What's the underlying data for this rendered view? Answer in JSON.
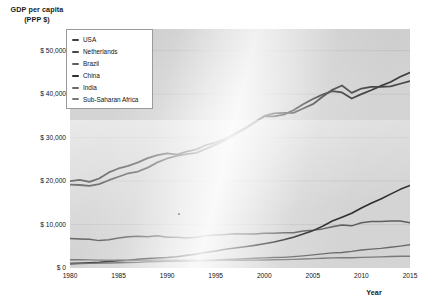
{
  "chart_data": {
    "type": "line",
    "title": "",
    "ylabel": "GDP per capita\n(PPP $)",
    "ylabel_line1": "GDP per capita",
    "ylabel_line2": "(PPP $)",
    "xlabel": "Year",
    "xlim": [
      1980,
      2015
    ],
    "ylim": [
      0,
      55000
    ],
    "grid": true,
    "legend_position": "top-left",
    "yticks": [
      {
        "value": 50000,
        "label": "$ 50,000"
      },
      {
        "value": 40000,
        "label": "$ 40,000"
      },
      {
        "value": 30000,
        "label": "$ 30,000"
      },
      {
        "value": 20000,
        "label": "$ 20,000"
      },
      {
        "value": 10000,
        "label": "$ 10,000"
      },
      {
        "value": 0,
        "label": "$ 0"
      }
    ],
    "xticks": [
      {
        "value": 1980,
        "label": "1980"
      },
      {
        "value": 1985,
        "label": "1985"
      },
      {
        "value": 1990,
        "label": "1990"
      },
      {
        "value": 1995,
        "label": "1995"
      },
      {
        "value": 2000,
        "label": "2000"
      },
      {
        "value": 2005,
        "label": "2005"
      },
      {
        "value": 2010,
        "label": "2010"
      },
      {
        "value": 2015,
        "label": "2015"
      }
    ],
    "x": [
      1980,
      1981,
      1982,
      1983,
      1984,
      1985,
      1986,
      1987,
      1988,
      1989,
      1990,
      1991,
      1992,
      1993,
      1994,
      1995,
      1996,
      1997,
      1998,
      1999,
      2000,
      2001,
      2002,
      2003,
      2004,
      2005,
      2006,
      2007,
      2008,
      2009,
      2010,
      2011,
      2012,
      2013,
      2014,
      2015
    ],
    "series": [
      {
        "name": "USA",
        "color": "#3f3f3f",
        "width": 1.8,
        "values": [
          20000,
          20300,
          19800,
          20600,
          22000,
          22900,
          23500,
          24300,
          25300,
          26000,
          26400,
          26100,
          26800,
          27300,
          28300,
          28900,
          29800,
          31000,
          32200,
          33600,
          34900,
          34900,
          35300,
          36300,
          37700,
          38900,
          39900,
          40700,
          40400,
          39000,
          40000,
          40900,
          41900,
          42800,
          44000,
          45000
        ]
      },
      {
        "name": "Netherlands",
        "color": "#474747",
        "width": 1.8,
        "values": [
          19200,
          19100,
          18900,
          19300,
          20200,
          21000,
          21800,
          22200,
          23100,
          24300,
          25200,
          25800,
          26200,
          26500,
          27400,
          28400,
          29400,
          30700,
          32000,
          33400,
          35000,
          35600,
          35700,
          35700,
          36700,
          37700,
          39400,
          41000,
          42000,
          40300,
          41300,
          41700,
          41700,
          41800,
          42400,
          43000
        ]
      },
      {
        "name": "Brazil",
        "color": "#5e5e5e",
        "width": 1.5,
        "values": [
          6800,
          6700,
          6600,
          6300,
          6500,
          6900,
          7200,
          7300,
          7200,
          7400,
          7100,
          7100,
          6900,
          7100,
          7400,
          7600,
          7700,
          7900,
          7800,
          7800,
          8000,
          8000,
          8100,
          8100,
          8500,
          8700,
          9000,
          9500,
          9900,
          9700,
          10400,
          10700,
          10700,
          10800,
          10800,
          10400
        ]
      },
      {
        "name": "China",
        "color": "#2e2e2e",
        "width": 1.6,
        "values": [
          1000,
          1100,
          1200,
          1300,
          1500,
          1700,
          1800,
          2000,
          2200,
          2300,
          2400,
          2600,
          2900,
          3200,
          3600,
          3900,
          4300,
          4600,
          4900,
          5200,
          5600,
          6000,
          6500,
          7100,
          7800,
          8600,
          9600,
          10800,
          11700,
          12600,
          13800,
          14900,
          15900,
          17000,
          18100,
          19000
        ]
      },
      {
        "name": "India",
        "color": "#6a6a6a",
        "width": 1.4,
        "values": [
          1000,
          1030,
          1060,
          1120,
          1160,
          1210,
          1260,
          1300,
          1400,
          1470,
          1530,
          1530,
          1590,
          1650,
          1740,
          1850,
          1970,
          2030,
          2120,
          2240,
          2320,
          2400,
          2440,
          2610,
          2800,
          3010,
          3240,
          3480,
          3580,
          3830,
          4150,
          4350,
          4520,
          4760,
          5030,
          5350
        ]
      },
      {
        "name": "Sub-Saharan Africa",
        "color": "#7a7a7a",
        "width": 1.4,
        "values": [
          1900,
          1900,
          1870,
          1810,
          1790,
          1810,
          1800,
          1780,
          1800,
          1820,
          1810,
          1790,
          1740,
          1710,
          1710,
          1730,
          1760,
          1790,
          1800,
          1820,
          1850,
          1890,
          1930,
          1990,
          2070,
          2150,
          2230,
          2320,
          2390,
          2370,
          2440,
          2500,
          2560,
          2630,
          2690,
          2720
        ]
      }
    ]
  },
  "legend": {
    "items": [
      {
        "label": "USA"
      },
      {
        "label": "Netherlands"
      },
      {
        "label": "Brazil"
      },
      {
        "label": "China"
      },
      {
        "label": "India"
      },
      {
        "label": "Sub-Saharan Africa"
      }
    ]
  }
}
